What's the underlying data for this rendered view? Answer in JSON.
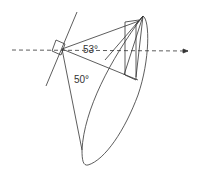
{
  "diagram": {
    "type": "antenna-beam-geometry",
    "labels": {
      "angle_horizontal": "53°",
      "angle_vertical": "50°"
    },
    "colors": {
      "line": "#333333",
      "background": "#ffffff"
    }
  }
}
